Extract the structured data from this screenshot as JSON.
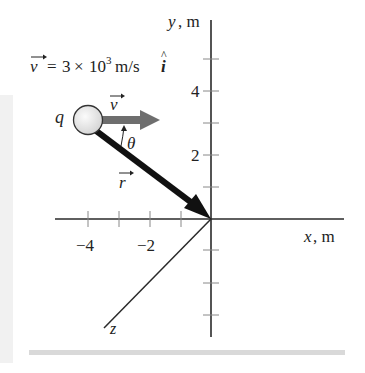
{
  "diagram": {
    "equation": {
      "vector_symbol": "v",
      "equals": "=",
      "coefficient": "3",
      "times": "×",
      "base": "10",
      "exponent": "3",
      "unit": "m/s",
      "unit_vector": "i"
    },
    "axes": {
      "y_label_var": "y",
      "y_label_unit": ", m",
      "x_label_var": "x",
      "x_label_unit": ", m",
      "z_label": "z",
      "y_tick_labels": [
        {
          "value": "4",
          "y": 91
        },
        {
          "value": "2",
          "y": 155
        }
      ],
      "x_tick_labels": [
        {
          "value": "−4",
          "x": 88
        },
        {
          "value": "−2",
          "x": 150
        }
      ]
    },
    "charge": {
      "label": "q"
    },
    "velocity_vector": {
      "label": "v"
    },
    "position_vector": {
      "label": "r"
    },
    "angle": {
      "label": "θ"
    },
    "colors": {
      "axis": "#2a2a2a",
      "position_arrow": "#111111",
      "velocity_arrow": "#6e6e6e",
      "charge_fill": "#e6e6e6",
      "charge_stroke": "#333333"
    }
  }
}
